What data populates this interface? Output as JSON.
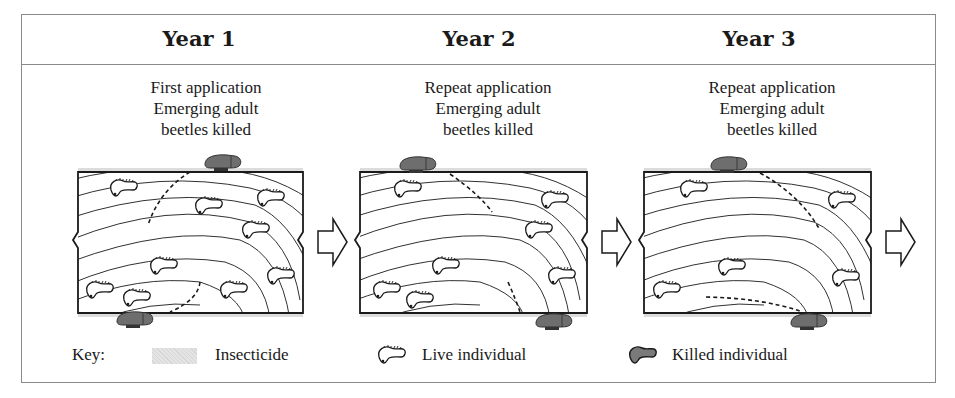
{
  "diagram": {
    "type": "insecticide-application-timeline",
    "panels": [
      {
        "year_label": "Year 1",
        "description_lines": [
          "First application",
          "Emerging adult",
          "beetles killed"
        ],
        "live_larvae_count": 9,
        "killed_adults_count": 2
      },
      {
        "year_label": "Year 2",
        "description_lines": [
          "Repeat application",
          "Emerging adult",
          "beetles killed"
        ],
        "live_larvae_count": 7,
        "killed_adults_count": 2
      },
      {
        "year_label": "Year 3",
        "description_lines": [
          "Repeat application",
          "Emerging adult",
          "beetles killed"
        ],
        "live_larvae_count": 5,
        "killed_adults_count": 2
      }
    ],
    "arrows": [
      "next-year-arrow",
      "next-year-arrow",
      "next-year-arrow"
    ]
  },
  "legend": {
    "key_label": "Key:",
    "items": [
      {
        "icon": "insecticide-swatch-icon",
        "label": "Insecticide"
      },
      {
        "icon": "live-larva-icon",
        "label": "Live individual"
      },
      {
        "icon": "killed-beetle-icon",
        "label": "Killed individual"
      }
    ]
  },
  "colors": {
    "line": "#1a1a1a",
    "frame_border": "#8a8a8a",
    "insecticide": "#dcdcdc",
    "killed_fill": "#6e6e6e"
  }
}
